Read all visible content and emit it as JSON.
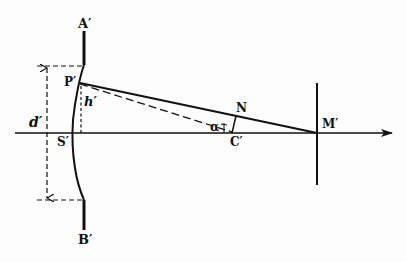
{
  "diagram": {
    "type": "optics-geometry",
    "labels": {
      "A": "A′",
      "B": "B′",
      "P": "P′",
      "S": "S′",
      "N": "N",
      "C": "C′",
      "M": "M′",
      "d": "d′",
      "h": "h′",
      "alpha": "α"
    },
    "colors": {
      "ink": "#111111",
      "background": "#fdfdfd"
    }
  }
}
